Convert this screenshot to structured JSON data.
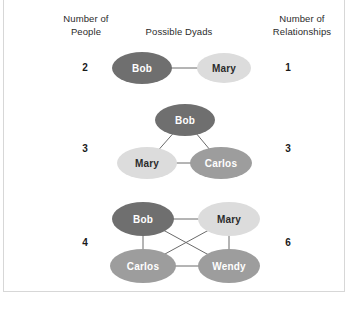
{
  "figure": {
    "headers": {
      "people": "Number of\nPeople",
      "dyads": "Possible Dyads",
      "relationships": "Number of\nRelationships"
    },
    "rows": [
      {
        "people_count": "2",
        "relationship_count": "1",
        "nodes": [
          {
            "label": "Bob",
            "shade": "dark",
            "cx": 142,
            "cy": 68,
            "rx": 30,
            "ry": 16
          },
          {
            "label": "Mary",
            "shade": "light",
            "cx": 224,
            "cy": 68,
            "rx": 27,
            "ry": 15
          }
        ],
        "edges": [
          [
            0,
            1
          ]
        ]
      },
      {
        "people_count": "3",
        "relationship_count": "3",
        "nodes": [
          {
            "label": "Bob",
            "shade": "dark",
            "cx": 185,
            "cy": 120,
            "rx": 30,
            "ry": 16
          },
          {
            "label": "Mary",
            "shade": "light",
            "cx": 147,
            "cy": 163,
            "rx": 30,
            "ry": 16
          },
          {
            "label": "Carlos",
            "shade": "mid",
            "cx": 221,
            "cy": 163,
            "rx": 31,
            "ry": 16
          }
        ],
        "edges": [
          [
            0,
            1
          ],
          [
            0,
            2
          ],
          [
            1,
            2
          ]
        ]
      },
      {
        "people_count": "4",
        "relationship_count": "6",
        "nodes": [
          {
            "label": "Bob",
            "shade": "dark",
            "cx": 143,
            "cy": 219,
            "rx": 31,
            "ry": 17
          },
          {
            "label": "Mary",
            "shade": "light",
            "cx": 229,
            "cy": 219,
            "rx": 31,
            "ry": 17
          },
          {
            "label": "Carlos",
            "shade": "mid",
            "cx": 143,
            "cy": 266,
            "rx": 33,
            "ry": 17
          },
          {
            "label": "Wendy",
            "shade": "mid",
            "cx": 229,
            "cy": 266,
            "rx": 31,
            "ry": 17
          }
        ],
        "edges": [
          [
            0,
            1
          ],
          [
            0,
            2
          ],
          [
            0,
            3
          ],
          [
            1,
            2
          ],
          [
            1,
            3
          ],
          [
            2,
            3
          ]
        ]
      }
    ],
    "label_columns": {
      "people_x": 85,
      "relationships_x": 288
    },
    "colors": {
      "dark": "#6f6f6f",
      "mid": "#9d9d9d",
      "light": "#dcdcdc",
      "edge": "#6a6a6a",
      "background": "#ffffff",
      "frame": "#d7d7d7"
    }
  }
}
